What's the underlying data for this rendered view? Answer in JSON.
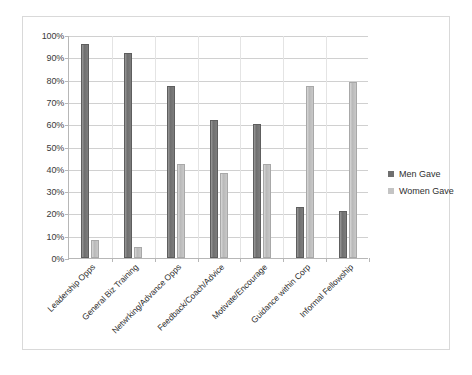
{
  "chart_data": {
    "type": "bar",
    "title": "",
    "subtitle": "",
    "xlabel": "",
    "ylabel": "",
    "ylim": [
      0,
      100
    ],
    "ytick_labels": [
      "0%",
      "10%",
      "20%",
      "30%",
      "40%",
      "50%",
      "60%",
      "70%",
      "80%",
      "90%",
      "100%"
    ],
    "ytick_values": [
      0,
      10,
      20,
      30,
      40,
      50,
      60,
      70,
      80,
      90,
      100
    ],
    "grid": true,
    "legend_position": "right",
    "categories": [
      "Leadership Opps",
      "General Biz Training",
      "Netwrking/Advance Opps",
      "Feedback/Coach/Advice",
      "Motivate/Encourage",
      "Guidance within Corp",
      "Informal Fellowship"
    ],
    "series": [
      {
        "name": "Men Gave",
        "color": "#6f6f6f",
        "values": [
          96,
          92,
          77,
          62,
          60,
          23,
          21
        ]
      },
      {
        "name": "Women Gave",
        "color": "#c0c0c0",
        "values": [
          8,
          5,
          42,
          38,
          42,
          77,
          79
        ]
      }
    ]
  },
  "legend": {
    "items": [
      {
        "label": "Men Gave",
        "color": "#6f6f6f"
      },
      {
        "label": "Women Gave",
        "color": "#c4c4c4"
      }
    ]
  },
  "colors": {
    "men_bar": "#6f6f6f",
    "women_bar": "#c0c0c0",
    "gridline": "#d0d0d0",
    "axis": "#b7b7b7",
    "frame_border": "#d9d9d9",
    "text": "#2f2f2f",
    "background": "#ffffff"
  }
}
